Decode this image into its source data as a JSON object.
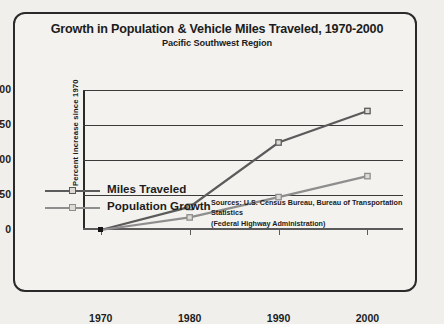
{
  "chart_data": {
    "type": "line",
    "title": "Growth in Population & Vehicle Miles Traveled, 1970-2000",
    "subtitle": "Pacific Southwest Region",
    "xlabel": "",
    "ylabel": "Percent increase since 1970",
    "x": [
      1970,
      1980,
      1990,
      2000
    ],
    "xtick_labels": [
      "1970",
      "1980",
      "1990",
      "2000"
    ],
    "ytick_labels": [
      "0",
      "50",
      "100",
      "150",
      "200"
    ],
    "ytick_values": [
      0,
      50,
      100,
      150,
      200
    ],
    "ylim": [
      0,
      200
    ],
    "xlim": [
      1968,
      2004
    ],
    "grid": "horizontal",
    "legend_position": "bottom-left",
    "series": [
      {
        "name": "Miles Traveled",
        "color": "#5b5b5b",
        "marker": "square",
        "values": [
          0,
          33,
          125,
          170
        ]
      },
      {
        "name": "Population Growth",
        "color": "#8e8e8e",
        "marker": "square",
        "values": [
          0,
          18,
          47,
          77
        ]
      }
    ],
    "annotations": {
      "source_line1": "Sources: U.S. Census Bureau, Bureau of Transportation Statistics",
      "source_line2": "(Federal Highway Administration)"
    }
  },
  "legend": {
    "items": [
      {
        "label": "Miles Traveled"
      },
      {
        "label": "Population Growth"
      }
    ]
  }
}
